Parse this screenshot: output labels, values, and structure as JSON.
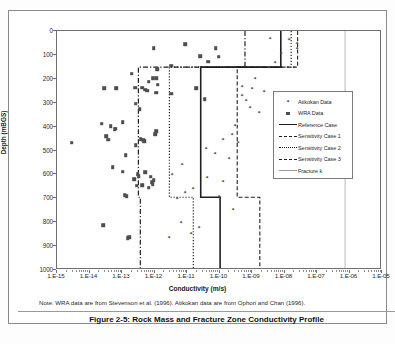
{
  "caption": "Figure 2-5: Rock Mass and Fracture Zone Conductivity Profile",
  "note": "Note:  WRA data are from Stevenson et al. (1996).  Atikokan data are from Ophori and Chan (1996).",
  "chart_data": {
    "type": "scatter",
    "title": "Rock Mass and Fracture Zone Conductivity Profile",
    "xlabel": "Conductivity (m/s)",
    "ylabel": "Depth (mBGS)",
    "xscale": "log",
    "xlim": [
      1e-15,
      1e-05
    ],
    "ylim": [
      0,
      1000
    ],
    "y_inverted": true,
    "grid": false,
    "legend_position": "right-middle",
    "xticklabels": [
      "1.E-15",
      "1.E-14",
      "1.E-13",
      "1.E-12",
      "1.E-11",
      "1.E-10",
      "1.E-09",
      "1.E-08",
      "1.E-07",
      "1.E-06",
      "1.E-05"
    ],
    "xtickvalues": [
      -15,
      -14,
      -13,
      -12,
      -11,
      -10,
      -9,
      -8,
      -7,
      -6,
      -5
    ],
    "yticklabels": [
      "0",
      "100",
      "200",
      "300",
      "400",
      "500",
      "600",
      "700",
      "800",
      "900",
      "1000"
    ],
    "ytickvalues": [
      0,
      100,
      200,
      300,
      400,
      500,
      600,
      700,
      800,
      900,
      1000
    ],
    "series": [
      {
        "name": "Atikokan Data",
        "marker": "diamond",
        "color": "#4d4d4d",
        "points": [
          [
            -8.45,
            30
          ],
          [
            -7.85,
            32
          ],
          [
            -7.62,
            50
          ],
          [
            -7.62,
            72
          ],
          [
            -8.12,
            92
          ],
          [
            -8.3,
            128
          ],
          [
            -7.72,
            152
          ],
          [
            -8.48,
            152
          ],
          [
            -8.9,
            195
          ],
          [
            -9.3,
            232
          ],
          [
            -9.3,
            268
          ],
          [
            -9.0,
            240
          ],
          [
            -8.62,
            252
          ],
          [
            -9.05,
            320
          ],
          [
            -8.78,
            338
          ],
          [
            -9.18,
            288
          ],
          [
            -9.52,
            395
          ],
          [
            -9.62,
            432
          ],
          [
            -9.88,
            452
          ],
          [
            -9.42,
            465
          ],
          [
            -10.4,
            488
          ],
          [
            -10.15,
            512
          ],
          [
            -9.7,
            530
          ],
          [
            -11.15,
            555
          ],
          [
            -11.45,
            600
          ],
          [
            -10.38,
            612
          ],
          [
            -9.88,
            628
          ],
          [
            -10.8,
            655
          ],
          [
            -11.05,
            672
          ],
          [
            -10.02,
            690
          ],
          [
            -11.3,
            700
          ],
          [
            -9.58,
            745
          ],
          [
            -11.18,
            800
          ],
          [
            -10.62,
            820
          ],
          [
            -10.88,
            845
          ],
          [
            -11.55,
            862
          ]
        ]
      },
      {
        "name": "WRA Data",
        "marker": "square",
        "color": "#4d4d4d",
        "points": [
          [
            -12.02,
            72
          ],
          [
            -11.05,
            55
          ],
          [
            -10.12,
            72
          ],
          [
            -10.6,
            105
          ],
          [
            -10.02,
            108
          ],
          [
            -10.35,
            128
          ],
          [
            -11.48,
            145
          ],
          [
            -11.92,
            160
          ],
          [
            -12.7,
            178
          ],
          [
            -11.95,
            198
          ],
          [
            -12.18,
            212
          ],
          [
            -12.05,
            198
          ],
          [
            -11.9,
            225
          ],
          [
            -13.55,
            240
          ],
          [
            -13.18,
            240
          ],
          [
            -12.6,
            238
          ],
          [
            -12.38,
            238
          ],
          [
            -12.28,
            245
          ],
          [
            -12.22,
            250
          ],
          [
            -10.72,
            240
          ],
          [
            -11.95,
            258
          ],
          [
            -11.48,
            262
          ],
          [
            -10.45,
            285
          ],
          [
            -12.58,
            305
          ],
          [
            -12.45,
            328
          ],
          [
            -12.98,
            382
          ],
          [
            -13.62,
            388
          ],
          [
            -13.35,
            398
          ],
          [
            -13.2,
            408
          ],
          [
            -13.22,
            412
          ],
          [
            -11.95,
            420
          ],
          [
            -11.98,
            432
          ],
          [
            -13.48,
            440
          ],
          [
            -13.42,
            455
          ],
          [
            -12.42,
            452
          ],
          [
            -12.35,
            455
          ],
          [
            -12.32,
            462
          ],
          [
            -12.58,
            478
          ],
          [
            -14.55,
            468
          ],
          [
            -12.88,
            520
          ],
          [
            -13.28,
            570
          ],
          [
            -12.98,
            588
          ],
          [
            -12.28,
            592
          ],
          [
            -12.52,
            598
          ],
          [
            -12.48,
            608
          ],
          [
            -12.12,
            610
          ],
          [
            -12.62,
            620
          ],
          [
            -12.02,
            625
          ],
          [
            -12.08,
            632
          ],
          [
            -12.05,
            640
          ],
          [
            -12.38,
            645
          ],
          [
            -12.55,
            648
          ],
          [
            -12.18,
            655
          ],
          [
            -12.92,
            688
          ],
          [
            -12.85,
            692
          ],
          [
            -13.58,
            812
          ],
          [
            -12.78,
            862
          ],
          [
            -12.82,
            868
          ]
        ]
      }
    ],
    "step_profiles": [
      {
        "name": "Reference Case",
        "style": "solid",
        "width": 1.6,
        "color": "#1f1f1f",
        "vertices": [
          [
            -8.07,
            0
          ],
          [
            -8.07,
            152
          ],
          [
            -10.55,
            152
          ],
          [
            -10.55,
            700
          ],
          [
            -9.95,
            700
          ],
          [
            -9.95,
            1000
          ]
        ]
      },
      {
        "name": "Sensitivity Case 1",
        "style": "dashed",
        "width": 1.1,
        "color": "#1f1f1f",
        "vertices": [
          [
            -7.55,
            0
          ],
          [
            -7.55,
            152
          ],
          [
            -9.42,
            152
          ],
          [
            -9.42,
            700
          ],
          [
            -8.72,
            700
          ],
          [
            -8.72,
            1000
          ]
        ]
      },
      {
        "name": "Sensitivity Case 2",
        "style": "dotted",
        "width": 1.2,
        "color": "#1f1f1f",
        "vertices": [
          [
            -7.75,
            0
          ],
          [
            -7.75,
            152
          ],
          [
            -11.52,
            152
          ],
          [
            -11.52,
            700
          ],
          [
            -10.78,
            700
          ],
          [
            -10.78,
            1000
          ]
        ]
      },
      {
        "name": "Sensitivity Case 3",
        "style": "dashdot",
        "width": 1.2,
        "color": "#1f1f1f",
        "vertices": [
          [
            -9.18,
            0
          ],
          [
            -9.18,
            152
          ],
          [
            -12.48,
            152
          ],
          [
            -12.48,
            700
          ],
          [
            -12.42,
            700
          ],
          [
            -12.42,
            1000
          ]
        ]
      },
      {
        "name": "Fracture k",
        "style": "thin-solid",
        "width": 0.7,
        "color": "#9a9a9a",
        "vertices": [
          [
            -6.08,
            0
          ],
          [
            -6.08,
            1000
          ]
        ]
      }
    ]
  },
  "axis": {
    "x_title": "Conductivity (m/s)",
    "y_title": "Depth (mBGS)"
  },
  "legend": {
    "items": [
      {
        "label": "Atikokan Data",
        "symbol": "diamond-marker"
      },
      {
        "label": "WRA Data",
        "symbol": "square-marker"
      },
      {
        "label": "Reference Case",
        "symbol": "solid-line"
      },
      {
        "label": "Sensitivity Case 1",
        "symbol": "dashed-line"
      },
      {
        "label": "Sensitivity Case 2",
        "symbol": "dotted-line"
      },
      {
        "label": "Sensitivity Case 3",
        "symbol": "dashdot-line"
      },
      {
        "label": "Fracture k",
        "symbol": "thin-line"
      }
    ]
  }
}
